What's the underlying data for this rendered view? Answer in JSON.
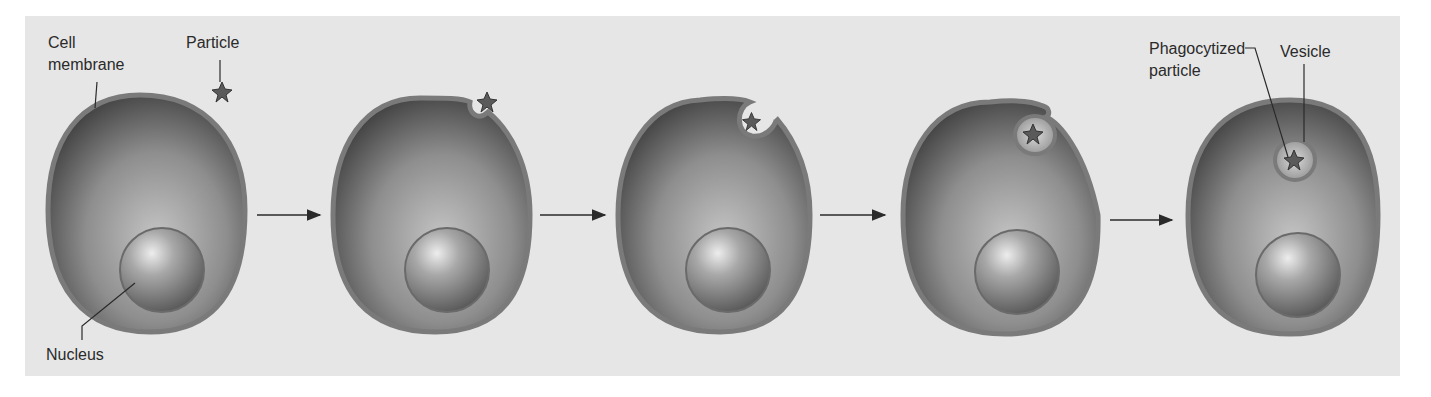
{
  "diagram": {
    "type": "process-sequence",
    "colors": {
      "background_panel": "#e6e6e6",
      "membrane": "#7a7a7a",
      "cytoplasm_dark": "#4a4a4a",
      "cytoplasm_light": "#bdbdbd",
      "leader_line": "#2a2a2a"
    },
    "labels": {
      "cell_membrane_line1": "Cell",
      "cell_membrane_line2": "membrane",
      "particle": "Particle",
      "nucleus": "Nucleus",
      "phagocytized_line1": "Phagocytized",
      "phagocytized_line2": "particle",
      "vesicle": "Vesicle"
    },
    "stages": [
      {
        "index": 1,
        "description": "Particle approaches cell"
      },
      {
        "index": 2,
        "description": "Cell membrane begins to indent around particle"
      },
      {
        "index": 3,
        "description": "Membrane surrounds particle"
      },
      {
        "index": 4,
        "description": "Membrane pinches off"
      },
      {
        "index": 5,
        "description": "Particle enclosed in vesicle inside cell"
      }
    ],
    "arrow_count": 4
  }
}
